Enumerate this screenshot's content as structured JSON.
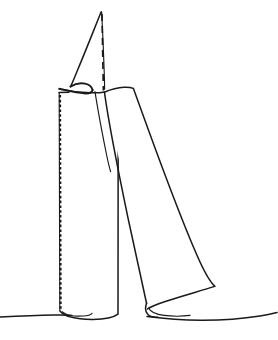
{
  "figure": {
    "title": "Line drawing of folded sheet and cylindrical roll",
    "kind": "hand-drawn line illustration",
    "background_color": "#ffffff",
    "ink_color": "#1a1a1a",
    "canvas": {
      "width": 278,
      "height": 340
    },
    "caption": "",
    "labels": [],
    "annotations": [],
    "elements": [
      {
        "name": "ground-line",
        "role": "baseline the objects rest on",
        "stroke": "#1a1a1a",
        "style": "solid"
      },
      {
        "name": "left-cylinder",
        "role": "upright rolled tube with seam",
        "stroke": "#1a1a1a",
        "style": "solid"
      },
      {
        "name": "cylinder-seam",
        "role": "stitched or torn left edge of tube",
        "stroke": "#1a1a1a",
        "style": "dashed-fine"
      },
      {
        "name": "cylinder-base-ellipse",
        "role": "open circular bottom of tube",
        "stroke": "#1a1a1a",
        "style": "solid"
      },
      {
        "name": "peak-flap",
        "role": "pointed triangular flap rising above the fold",
        "stroke": "#1a1a1a",
        "style": "solid"
      },
      {
        "name": "center-axis-line",
        "role": "vertical dashed construction axis through the peak",
        "stroke": "#1a1a1a",
        "style": "dashed-coarse"
      },
      {
        "name": "fold-crease",
        "role": "tight hooked crease where the flap doubles back",
        "stroke": "#1a1a1a",
        "style": "solid"
      },
      {
        "name": "right-panel",
        "role": "leaning quadrilateral sheet with curled lower lip",
        "stroke": "#1a1a1a",
        "style": "solid"
      },
      {
        "name": "right-panel-curl",
        "role": "rolled bottom edge of the leaning sheet",
        "stroke": "#1a1a1a",
        "style": "solid"
      }
    ]
  }
}
